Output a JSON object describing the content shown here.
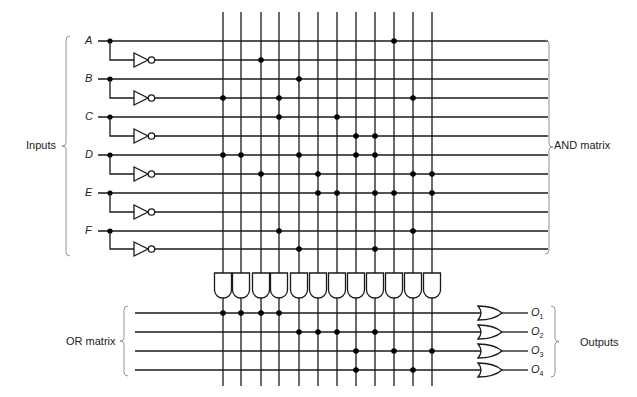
{
  "labels": {
    "inputs": "Inputs",
    "and_matrix": "AND matrix",
    "or_matrix": "OR matrix",
    "outputs": "Outputs"
  },
  "inputs": [
    {
      "name": "A",
      "y": 41
    },
    {
      "name": "B",
      "y": 79
    },
    {
      "name": "C",
      "y": 117
    },
    {
      "name": "D",
      "y": 155
    },
    {
      "name": "E",
      "y": 193
    },
    {
      "name": "F",
      "y": 231
    }
  ],
  "outputs": [
    {
      "name": "O",
      "sub": "1",
      "y": 313
    },
    {
      "name": "O",
      "sub": "2",
      "y": 332
    },
    {
      "name": "O",
      "sub": "3",
      "y": 351
    },
    {
      "name": "O",
      "sub": "4",
      "y": 370
    }
  ],
  "geometry": {
    "columns_x": [
      223,
      241,
      261,
      279,
      299,
      318,
      337,
      356,
      375,
      394,
      413,
      432
    ],
    "and_rows_y": [
      41,
      60,
      79,
      98,
      117,
      136,
      155,
      174,
      193,
      212,
      231,
      249
    ],
    "or_rows_y": [
      313,
      332,
      351,
      370
    ]
  },
  "and_matrix_connections": [
    [
      9
    ],
    [
      2
    ],
    [
      4
    ],
    [
      0,
      3,
      10
    ],
    [
      3,
      6
    ],
    [
      7,
      8
    ],
    [
      0,
      1,
      4,
      7,
      8
    ],
    [
      2,
      5,
      10,
      11
    ],
    [
      5,
      6,
      8,
      9,
      11
    ],
    [],
    [
      3,
      10
    ],
    [
      4,
      8
    ]
  ],
  "or_matrix_connections": [
    [
      0,
      1,
      2,
      3
    ],
    [
      4,
      5,
      6,
      8
    ],
    [
      7,
      9,
      11
    ],
    [
      7,
      10
    ]
  ],
  "colors": {
    "line": "#1a1a1a",
    "dot": "#000000",
    "bracket": "#888888",
    "text": "#222222"
  }
}
